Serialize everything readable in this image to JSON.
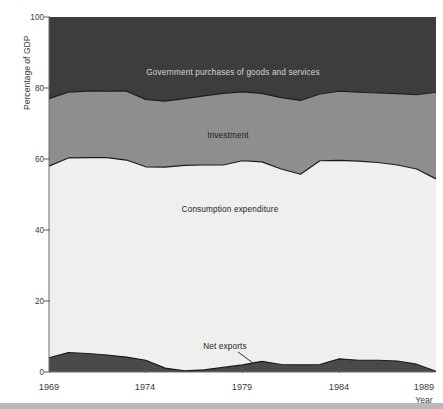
{
  "figure": {
    "ghost_title": "",
    "background_color": "#ffffff"
  },
  "axes": {
    "y_axis_title": "Percentage of GDP",
    "x_axis_title": "Year",
    "y_ticks": [
      "0",
      "20",
      "40",
      "60",
      "80",
      "100"
    ],
    "x_ticks": [
      "1969",
      "1974",
      "1979",
      "1984",
      "1989"
    ]
  },
  "colors": {
    "government": "#3d3d3d",
    "investment": "#8e8e8e",
    "consumption": "#efefee",
    "net_exports": "#4a4a4a",
    "outline": "#1b1b1b",
    "axis": "#6f6f6f",
    "text": "#3a3a3a",
    "label_on_dark": "#d6d6d6",
    "label_on_light": "#1d1d1d"
  },
  "labels": {
    "government": "Government purchases of goods and services",
    "investment": "Investment",
    "consumption": "Consumption expenditure",
    "net_exports": "Net exports"
  },
  "chart_data": {
    "type": "area",
    "stacked": true,
    "title": "",
    "xlabel": "Year",
    "ylabel": "Percentage of GDP",
    "xlim": [
      1969,
      1989
    ],
    "ylim": [
      0,
      100
    ],
    "grid": false,
    "legend": "inline-labels",
    "x": [
      1969,
      1970,
      1971,
      1972,
      1973,
      1974,
      1975,
      1976,
      1977,
      1978,
      1979,
      1980,
      1981,
      1982,
      1983,
      1984,
      1985,
      1986,
      1987,
      1988,
      1989
    ],
    "series": [
      {
        "name": "Net exports",
        "order": 1,
        "values": [
          4.0,
          5.5,
          5.2,
          4.8,
          4.2,
          3.3,
          1.1,
          0.3,
          0.6,
          1.3,
          2.0,
          3.0,
          2.1,
          2.0,
          2.1,
          3.7,
          3.3,
          3.3,
          3.1,
          2.2,
          0.2
        ]
      },
      {
        "name": "Consumption expenditure",
        "order": 2,
        "values": [
          54.0,
          54.8,
          55.2,
          55.6,
          55.5,
          54.5,
          56.6,
          57.9,
          57.7,
          57.0,
          57.5,
          56.2,
          55.1,
          53.7,
          57.4,
          55.9,
          56.1,
          55.7,
          55.2,
          55.0,
          54.2
        ]
      },
      {
        "name": "Investment",
        "order": 3,
        "values": [
          19.0,
          18.5,
          18.7,
          18.8,
          19.4,
          19.0,
          18.6,
          18.8,
          19.5,
          20.2,
          19.4,
          19.3,
          20.1,
          20.8,
          18.8,
          19.5,
          19.4,
          19.6,
          20.1,
          20.9,
          24.4
        ]
      },
      {
        "name": "Government purchases of goods and services",
        "order": 4,
        "values": [
          23.0,
          21.2,
          20.9,
          20.8,
          20.9,
          23.2,
          23.7,
          23.0,
          22.2,
          21.5,
          21.1,
          21.5,
          22.7,
          23.5,
          21.7,
          20.9,
          21.2,
          21.4,
          21.6,
          21.9,
          21.2
        ]
      }
    ],
    "cumulative_boundaries": {
      "net_exports_top": [
        4.0,
        5.5,
        5.2,
        4.8,
        4.2,
        3.3,
        1.1,
        0.3,
        0.6,
        1.3,
        2.0,
        3.0,
        2.1,
        2.0,
        2.1,
        3.7,
        3.3,
        3.3,
        3.1,
        2.2,
        0.2
      ],
      "consumption_top": [
        58.0,
        60.3,
        60.4,
        60.4,
        59.7,
        57.8,
        57.7,
        58.2,
        58.3,
        58.3,
        59.5,
        59.2,
        57.2,
        55.7,
        59.5,
        59.6,
        59.4,
        59.0,
        58.3,
        57.2,
        54.4
      ],
      "investment_top": [
        77.0,
        78.8,
        79.1,
        79.2,
        79.1,
        76.8,
        76.3,
        77.0,
        77.8,
        78.5,
        78.9,
        78.5,
        77.3,
        76.5,
        78.3,
        79.1,
        78.8,
        78.6,
        78.4,
        78.1,
        78.8
      ],
      "government_top": [
        100,
        100,
        100,
        100,
        100,
        100,
        100,
        100,
        100,
        100,
        100,
        100,
        100,
        100,
        100,
        100,
        100,
        100,
        100,
        100,
        100
      ]
    }
  }
}
